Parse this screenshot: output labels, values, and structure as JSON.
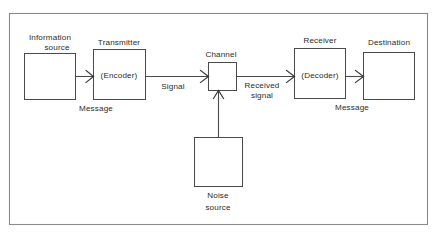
{
  "figure": {
    "background_color": "#ffffff",
    "frame_color": "#8a8a8a",
    "box_stroke_color": "#4a4a4a",
    "line_color": "#4a4a4a",
    "text_color": "#2b2b2b"
  },
  "nodes": {
    "information_source": {
      "label": "Information",
      "label_line2": "source",
      "inner_label": ""
    },
    "transmitter": {
      "label": "Transmitter",
      "inner_label": "(Encoder)"
    },
    "channel": {
      "label": "Channel",
      "inner_label": ""
    },
    "receiver": {
      "label": "Receiver",
      "inner_label": "(Decoder)"
    },
    "destination": {
      "label": "Destination",
      "inner_label": ""
    },
    "noise_source": {
      "label": "Noise",
      "label_line2": "source",
      "inner_label": ""
    }
  },
  "edge_labels": {
    "message_left": "Message",
    "signal": "Signal",
    "received_signal_line1": "Received",
    "received_signal_line2": "signal",
    "message_right": "Message"
  }
}
